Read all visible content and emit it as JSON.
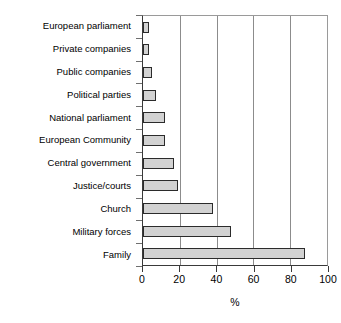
{
  "chart_data": {
    "type": "bar",
    "orientation": "horizontal",
    "title": "",
    "subtitle": "",
    "xlabel": "%",
    "ylabel": "",
    "xlim": [
      0,
      100
    ],
    "xticks": [
      0,
      20,
      40,
      60,
      80,
      100
    ],
    "xtick_labels": [
      "0",
      "20",
      "40",
      "60",
      "80",
      "100"
    ],
    "grid": "vertical",
    "legend": "none",
    "categories": [
      "European parliament",
      "Private companies",
      "Public companies",
      "Political parties",
      "National parliament",
      "European Community",
      "Central government",
      "Justice/courts",
      "Church",
      "Military forces",
      "Family"
    ],
    "values": [
      3,
      3,
      5,
      7,
      12,
      12,
      17,
      19,
      38,
      48,
      88
    ],
    "series": [
      {
        "name": "Percent",
        "values": [
          3,
          3,
          5,
          7,
          12,
          12,
          17,
          19,
          38,
          48,
          88
        ]
      }
    ],
    "colors": {
      "bar_fill": "#d2d2d2",
      "bar_border": "#2b2b2b",
      "gridline": "#8c8c8c",
      "axis": "#3a3a3a",
      "text": "#000000",
      "background": "#ffffff"
    }
  }
}
